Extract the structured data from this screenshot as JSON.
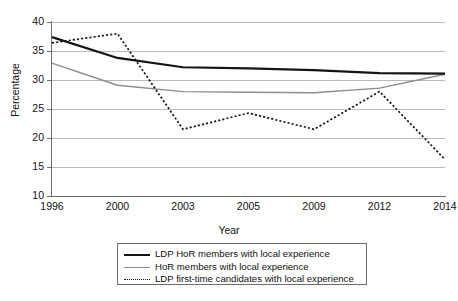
{
  "chart_data": {
    "type": "line",
    "title": "",
    "xlabel": "Year",
    "ylabel": "Percentage",
    "categories": [
      "1996",
      "2000",
      "2003",
      "2005",
      "2009",
      "2012",
      "2014"
    ],
    "ylim": [
      10,
      40
    ],
    "yticks": [
      10,
      15,
      20,
      25,
      30,
      35,
      40
    ],
    "grid": true,
    "legend_position": "below-plot",
    "series": [
      {
        "name": "LDP HoR members with local experience",
        "style": "solid-thick-black",
        "color": "#141414",
        "values": [
          37.4,
          33.8,
          32.2,
          32.0,
          31.7,
          31.2,
          31.1
        ]
      },
      {
        "name": "HoR members with local experience",
        "style": "solid-thin-gray",
        "color": "#8d8d8d",
        "values": [
          32.9,
          29.1,
          28.0,
          27.9,
          27.8,
          28.6,
          31.0
        ]
      },
      {
        "name": "LDP first-time candidates with local experience",
        "style": "dotted-black",
        "color": "#141414",
        "values": [
          36.4,
          38.0,
          21.5,
          24.3,
          21.5,
          28.0,
          16.3
        ]
      }
    ]
  },
  "axes": {
    "y_label": "Percentage",
    "x_label": "Year",
    "y_tick_labels": [
      "40",
      "35",
      "30",
      "25",
      "20",
      "15",
      "10"
    ],
    "x_tick_labels": [
      "1996",
      "2000",
      "2003",
      "2005",
      "2009",
      "2012",
      "2014"
    ]
  },
  "legend": {
    "items": [
      {
        "label": "LDP HoR members with local experience",
        "swatch": "solid-thick-black"
      },
      {
        "label": "HoR members with local experience",
        "swatch": "solid-thin-gray"
      },
      {
        "label": "LDP first-time candidates with local experience",
        "swatch": "dotted-black"
      }
    ]
  },
  "colors": {
    "ldp_hor": "#141414",
    "hor": "#8d8d8d",
    "first_time": "#141414",
    "gridline": "#b9b9b9",
    "axis": "#6e6e6e"
  }
}
